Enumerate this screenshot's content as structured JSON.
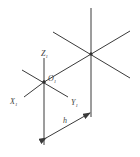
{
  "diagram": {
    "type": "axonometric-coordinate-axes",
    "colors": {
      "line": "#3a3a3a",
      "text": "#444444",
      "background": "#ffffff"
    },
    "labels": {
      "z_axis": "Z",
      "z_sub": "1",
      "x_axis": "X",
      "x_sub": "1",
      "y_axis": "Y",
      "y_sub": "1",
      "origin": "O",
      "origin_sub": "1",
      "dimension": "h"
    }
  }
}
